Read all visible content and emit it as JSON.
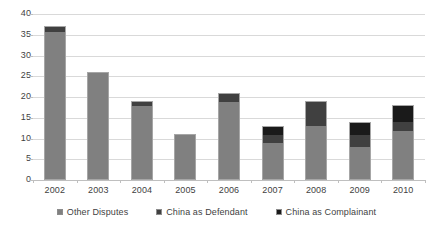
{
  "chart_data": {
    "type": "bar",
    "subtype": "stacked-column",
    "title": "",
    "subtitle": "",
    "xlabel": "",
    "ylabel": "",
    "categories": [
      "2002",
      "2003",
      "2004",
      "2005",
      "2006",
      "2007",
      "2008",
      "2009",
      "2010"
    ],
    "series": [
      {
        "name": "Other Disputes",
        "color": "#808080",
        "values": [
          36,
          26,
          18,
          11,
          19,
          9,
          13,
          8,
          12
        ]
      },
      {
        "name": "China as Defendant",
        "color": "#404040",
        "values": [
          1,
          0,
          1,
          0,
          2,
          2,
          6,
          3,
          2
        ]
      },
      {
        "name": "China as Complainant",
        "color": "#1a1a1a",
        "values": [
          0,
          0,
          0,
          0,
          0,
          2,
          0,
          3,
          4
        ]
      }
    ],
    "totals": [
      37,
      26,
      19,
      11,
      21,
      13,
      19,
      14,
      18
    ],
    "ylim": [
      0,
      40
    ],
    "ytick_step": 5,
    "yticks": [
      "0",
      "5",
      "10",
      "15",
      "20",
      "25",
      "30",
      "35",
      "40"
    ],
    "grid": true,
    "grid_axis": "y",
    "legend_position": "bottom",
    "legend": [
      "Other Disputes",
      "China as Defendant",
      "China as Complainant"
    ]
  },
  "colors": {
    "background": "#ffffff",
    "gridline": "#d9d9d9",
    "axis": "#bfbfbf",
    "text": "#3f3f3f",
    "series_other": "#808080",
    "series_defendant": "#404040",
    "series_complainant": "#1a1a1a"
  }
}
